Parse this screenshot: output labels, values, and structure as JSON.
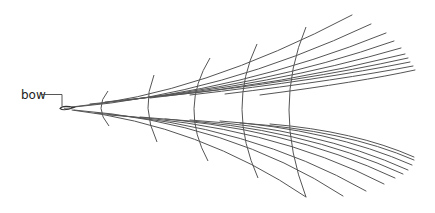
{
  "diagram": {
    "title": "",
    "labels": {
      "bow": "bow"
    },
    "colors": {
      "line": "#555555",
      "text": "#222222",
      "background": "#ffffff"
    },
    "transverse_wave_count": 5,
    "diverging_waves_upper_count": 10,
    "diverging_waves_lower_count": 10
  }
}
